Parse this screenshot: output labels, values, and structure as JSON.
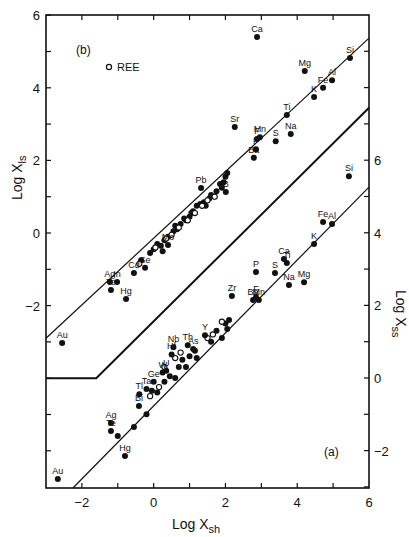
{
  "chart_data": {
    "type": "scatter",
    "title": "",
    "panels": [
      {
        "id": "b",
        "label": "(b)",
        "xlabel": "Log Xsh",
        "ylabel": "Log Xls",
        "y_axis": "left",
        "xlim": [
          -3,
          6
        ],
        "ylim": [
          -6,
          6
        ],
        "fit_line": {
          "x": [
            -3,
            6
          ],
          "y": [
            -2.9,
            5.37
          ]
        },
        "legend": [
          {
            "marker": "open-circle",
            "label": "REE",
            "x": -1.25,
            "y": 4.57
          }
        ],
        "labeled_points": [
          {
            "label": "Ca",
            "x": 2.88,
            "y": 5.4
          },
          {
            "label": "Si",
            "x": 5.47,
            "y": 4.82
          },
          {
            "label": "Mg",
            "x": 4.21,
            "y": 4.46
          },
          {
            "label": "Al",
            "x": 4.97,
            "y": 4.21
          },
          {
            "label": "Fe",
            "x": 4.72,
            "y": 4.0
          },
          {
            "label": "K",
            "x": 4.47,
            "y": 3.75
          },
          {
            "label": "Ti",
            "x": 3.71,
            "y": 3.25
          },
          {
            "label": "Sr",
            "x": 2.26,
            "y": 2.92
          },
          {
            "label": "Na",
            "x": 3.82,
            "y": 2.73
          },
          {
            "label": "Mn",
            "x": 2.96,
            "y": 2.64
          },
          {
            "label": "F",
            "x": 2.88,
            "y": 2.59
          },
          {
            "label": "S",
            "x": 3.4,
            "y": 2.53
          },
          {
            "label": "P",
            "x": 2.85,
            "y": 2.31
          },
          {
            "label": "Ba",
            "x": 2.79,
            "y": 2.07
          },
          {
            "label": "Pb",
            "x": 1.32,
            "y": 1.24
          },
          {
            "label": "B",
            "x": 2.01,
            "y": 1.13
          },
          {
            "label": "Mo",
            "x": 0.4,
            "y": -0.33
          },
          {
            "label": "Se",
            "x": -0.24,
            "y": -0.96
          },
          {
            "label": "Cd",
            "x": -0.55,
            "y": -1.1
          },
          {
            "label": "In",
            "x": -1.02,
            "y": -1.35
          },
          {
            "label": "Ag",
            "x": -1.22,
            "y": -1.35
          },
          {
            "label": "Te",
            "x": -1.19,
            "y": -1.57
          },
          {
            "label": "Hg",
            "x": -0.77,
            "y": -1.82
          },
          {
            "label": "Au",
            "x": -2.55,
            "y": -3.03
          }
        ],
        "cluster_points_filled": [
          [
            0.0,
            -0.45
          ],
          [
            0.1,
            -0.3
          ],
          [
            0.2,
            -0.35
          ],
          [
            0.3,
            -0.2
          ],
          [
            0.4,
            -0.1
          ],
          [
            0.55,
            0.05
          ],
          [
            0.6,
            0.2
          ],
          [
            0.75,
            0.25
          ],
          [
            0.85,
            0.4
          ],
          [
            0.9,
            0.35
          ],
          [
            1.05,
            0.55
          ],
          [
            1.1,
            0.6
          ],
          [
            1.2,
            0.75
          ],
          [
            1.3,
            0.8
          ],
          [
            1.4,
            0.85
          ],
          [
            1.55,
            0.95
          ],
          [
            1.6,
            1.05
          ],
          [
            1.75,
            1.15
          ],
          [
            1.85,
            1.35
          ],
          [
            1.95,
            1.4
          ],
          [
            2.0,
            1.55
          ],
          [
            2.05,
            1.65
          ],
          [
            -0.1,
            -0.55
          ],
          [
            0.25,
            -0.5
          ],
          [
            0.65,
            0.1
          ],
          [
            1.0,
            0.45
          ],
          [
            1.45,
            0.75
          ],
          [
            1.9,
            1.25
          ],
          [
            -0.35,
            -0.75
          ]
        ],
        "cluster_points_open": [
          [
            0.05,
            -0.4
          ],
          [
            0.35,
            -0.15
          ],
          [
            0.5,
            -0.05
          ],
          [
            0.7,
            0.15
          ],
          [
            0.95,
            0.35
          ],
          [
            1.15,
            0.55
          ],
          [
            1.35,
            0.75
          ],
          [
            1.5,
            0.9
          ],
          [
            1.7,
            1.0
          ],
          [
            -0.4,
            -0.85
          ]
        ]
      },
      {
        "id": "a",
        "label": "(a)",
        "xlabel": "Log Xsh",
        "ylabel": "Log Xss",
        "y_axis": "right",
        "xlim": [
          -3,
          6
        ],
        "ylim": [
          -3,
          9
        ],
        "fit_line": {
          "x": [
            -2.25,
            6
          ],
          "y": [
            -3.03,
            5.26
          ]
        },
        "labeled_points": [
          {
            "label": "Si",
            "x": 5.44,
            "y": 5.56
          },
          {
            "label": "Fe",
            "x": 4.72,
            "y": 4.3
          },
          {
            "label": "Al",
            "x": 4.97,
            "y": 4.24
          },
          {
            "label": "K",
            "x": 4.47,
            "y": 3.69
          },
          {
            "label": "Ca",
            "x": 3.63,
            "y": 3.28
          },
          {
            "label": "Ti",
            "x": 3.71,
            "y": 3.17
          },
          {
            "label": "P",
            "x": 2.85,
            "y": 2.92
          },
          {
            "label": "S",
            "x": 3.38,
            "y": 2.89
          },
          {
            "label": "Mg",
            "x": 4.19,
            "y": 2.64
          },
          {
            "label": "Na",
            "x": 3.77,
            "y": 2.56
          },
          {
            "label": "Zr",
            "x": 2.18,
            "y": 2.26
          },
          {
            "label": "F",
            "x": 2.85,
            "y": 2.23
          },
          {
            "label": "Ba",
            "x": 2.77,
            "y": 2.15
          },
          {
            "label": "Mn",
            "x": 2.93,
            "y": 2.15
          },
          {
            "label": "Y",
            "x": 1.43,
            "y": 1.18
          },
          {
            "label": "Th",
            "x": 0.95,
            "y": 0.9
          },
          {
            "label": "As",
            "x": 1.1,
            "y": 0.8
          },
          {
            "label": "Nb",
            "x": 0.55,
            "y": 0.85
          },
          {
            "label": "Hf",
            "x": 0.5,
            "y": 0.65
          },
          {
            "label": "U",
            "x": 0.35,
            "y": 0.2
          },
          {
            "label": "W",
            "x": 0.25,
            "y": 0.15
          },
          {
            "label": "Ge",
            "x": 0.0,
            "y": -0.1
          },
          {
            "label": "Ta",
            "x": -0.2,
            "y": -0.3
          },
          {
            "label": "Tl",
            "x": -0.4,
            "y": -0.45
          },
          {
            "label": "Bi",
            "x": -0.41,
            "y": -0.77
          },
          {
            "label": "Ag",
            "x": -1.19,
            "y": -1.24
          },
          {
            "label": "Te",
            "x": -1.19,
            "y": -1.46
          },
          {
            "label": "Hg",
            "x": -0.8,
            "y": -2.15
          },
          {
            "label": "Au",
            "x": -2.67,
            "y": -2.78
          }
        ],
        "cluster_points_filled": [
          [
            -1.0,
            -1.6
          ],
          [
            -0.55,
            -1.35
          ],
          [
            -0.2,
            -1.0
          ],
          [
            0.1,
            -0.4
          ],
          [
            0.3,
            -0.1
          ],
          [
            0.45,
            0.05
          ],
          [
            0.7,
            0.3
          ],
          [
            0.8,
            0.5
          ],
          [
            1.0,
            0.6
          ],
          [
            1.15,
            0.75
          ],
          [
            1.2,
            0.55
          ],
          [
            1.6,
            1.0
          ],
          [
            1.75,
            1.3
          ],
          [
            2.0,
            1.5
          ],
          [
            2.1,
            1.6
          ],
          [
            2.05,
            1.35
          ],
          [
            1.9,
            1.1
          ],
          [
            0.6,
            0.0
          ],
          [
            0.9,
            0.3
          ],
          [
            -0.05,
            -0.35
          ]
        ],
        "cluster_points_open": [
          [
            0.15,
            -0.25
          ],
          [
            0.3,
            0.3
          ],
          [
            0.6,
            0.55
          ],
          [
            0.75,
            0.7
          ],
          [
            1.5,
            1.1
          ],
          [
            1.65,
            1.2
          ],
          [
            1.9,
            1.55
          ],
          [
            -0.1,
            -0.5
          ]
        ]
      }
    ],
    "separator_line": {
      "points": [
        [
          -3,
          -4
        ],
        [
          -1.6,
          -4
        ],
        [
          6,
          3.45
        ]
      ]
    },
    "x_ticks": [
      -2,
      0,
      2,
      4,
      6
    ],
    "left_y_ticks": [
      6,
      4,
      2,
      0,
      -2
    ],
    "right_y_ticks": [
      6,
      4,
      2,
      0,
      -2
    ],
    "xlabel": "Log Xsh",
    "ylabel_left": "Log Xls",
    "ylabel_right": "Log Xss",
    "grid": false
  },
  "labels": {
    "panel_b": "(b)",
    "panel_a": "(a)",
    "legend_ree": "REE",
    "xlabel_main": "Log X",
    "xlabel_sub": "sh",
    "ylabel_left_main": "Log X",
    "ylabel_left_sub": "ls",
    "ylabel_right_main": "Log X",
    "ylabel_right_sub": "ss"
  }
}
